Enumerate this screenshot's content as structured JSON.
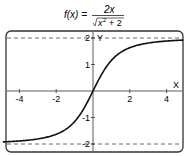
{
  "formula": {
    "lhs": "f(x) =",
    "numerator": "2x",
    "denominator_radicand_base": "x",
    "denominator_exp": "2",
    "denominator_rest": "+ 2"
  },
  "chart_data": {
    "type": "line",
    "xlabel": "X",
    "ylabel": "Y",
    "xlim": [
      -4.9,
      4.9
    ],
    "ylim": [
      -2.3,
      2.3
    ],
    "x_ticks": [
      -4,
      -2,
      2,
      4
    ],
    "x_tick_labels": [
      "-4",
      "-2",
      "2",
      "4"
    ],
    "y_ticks": [
      -2,
      -1,
      1,
      2
    ],
    "y_tick_labels": [
      "-2",
      "-1",
      "1",
      "2"
    ],
    "asymptotes": [
      2,
      -2
    ],
    "grid": false,
    "series": [
      {
        "name": "f(x)",
        "x": [
          -4.9,
          -4,
          -3,
          -2,
          -1.5,
          -1,
          -0.5,
          0,
          0.5,
          1,
          1.5,
          2,
          3,
          4,
          4.9
        ],
        "values": [
          -1.92,
          -1.89,
          -1.81,
          -1.63,
          -1.41,
          -1.15,
          -0.67,
          0,
          0.67,
          1.15,
          1.41,
          1.63,
          1.81,
          1.89,
          1.92
        ]
      }
    ]
  }
}
